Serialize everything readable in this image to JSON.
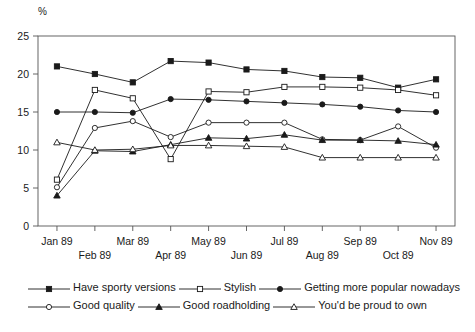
{
  "chart_data": {
    "type": "line",
    "title": "",
    "subtitle": "",
    "xlabel": "",
    "ylabel": "%",
    "ylim": [
      0,
      25
    ],
    "yticks": [
      0,
      5,
      10,
      15,
      20,
      25
    ],
    "grid": false,
    "legend_position": "bottom",
    "categories": [
      "Jan 89",
      "Feb 89",
      "Mar 89",
      "Apr 89",
      "May 89",
      "Jun 89",
      "Jul 89",
      "Aug 89",
      "Sep 89",
      "Oct 89",
      "Nov 89"
    ],
    "series": [
      {
        "name": "Have sporty versions",
        "marker": "filled-square",
        "values": [
          21.0,
          20.0,
          18.9,
          21.7,
          21.5,
          20.6,
          20.4,
          19.6,
          19.5,
          18.2,
          19.3
        ]
      },
      {
        "name": "Stylish",
        "marker": "open-square",
        "values": [
          6.1,
          17.9,
          16.8,
          8.8,
          17.7,
          17.6,
          18.3,
          18.3,
          18.2,
          17.9,
          17.2
        ]
      },
      {
        "name": "Getting more popular nowadays",
        "marker": "filled-circle",
        "values": [
          15.0,
          15.0,
          14.9,
          16.7,
          16.6,
          16.4,
          16.2,
          16.0,
          15.7,
          15.2,
          15.0
        ]
      },
      {
        "name": "Good quality",
        "marker": "open-circle",
        "values": [
          5.1,
          12.9,
          13.8,
          11.7,
          13.6,
          13.6,
          13.6,
          11.4,
          11.3,
          13.1,
          10.3
        ]
      },
      {
        "name": "Good roadholding",
        "marker": "filled-triangle",
        "values": [
          4.0,
          9.9,
          9.8,
          10.7,
          11.6,
          11.5,
          12.0,
          11.3,
          11.3,
          11.2,
          10.7
        ]
      },
      {
        "name": "You'd be proud to own",
        "marker": "open-triangle",
        "values": [
          11.0,
          10.0,
          10.1,
          10.6,
          10.6,
          10.5,
          10.4,
          9.0,
          9.0,
          9.0,
          9.0
        ]
      }
    ]
  },
  "axes": {
    "y_unit_label": "%",
    "ytick_labels": [
      "0",
      "5",
      "10",
      "15",
      "20",
      "25"
    ],
    "xtick_labels": [
      "Jan 89",
      "Feb 89",
      "Mar 89",
      "Apr 89",
      "May 89",
      "Jun 89",
      "Jul 89",
      "Aug 89",
      "Sep 89",
      "Oct 89",
      "Nov 89"
    ]
  },
  "legend": {
    "items": [
      {
        "label": "Have sporty versions",
        "marker": "filled-square"
      },
      {
        "label": "Stylish",
        "marker": "open-square"
      },
      {
        "label": "Getting more popular nowadays",
        "marker": "filled-circle"
      },
      {
        "label": "Good quality",
        "marker": "open-circle"
      },
      {
        "label": "Good roadholding",
        "marker": "filled-triangle"
      },
      {
        "label": "You'd be proud to own",
        "marker": "open-triangle"
      }
    ]
  },
  "style": {
    "line_color": "#1a1a1a",
    "frame_color": "#555555",
    "background": "#ffffff"
  }
}
